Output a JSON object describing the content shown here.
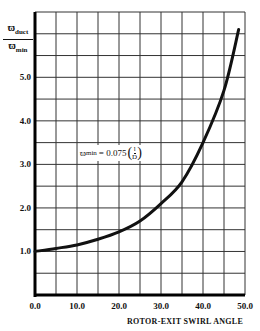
{
  "chart_data": {
    "type": "line",
    "title": "",
    "xlabel": "ROTOR-EXIT SWIRL ANGLE",
    "ylabel": "ϖ_duct / ϖ_min",
    "ylabel_parts": {
      "num_sym": "ϖ",
      "num_sub": "duct",
      "den_sym": "ϖ",
      "den_sub": "min"
    },
    "xlim": [
      0,
      50
    ],
    "ylim": [
      0,
      6.5
    ],
    "x_ticks": [
      "0.0",
      "10.0",
      "20.0",
      "30.0",
      "40.0",
      "50.0"
    ],
    "y_ticks": [
      "1.0",
      "2.0",
      "3.0",
      "4.0",
      "5.0"
    ],
    "grid": true,
    "annotation": {
      "lhs_sym": "ϖ",
      "lhs_sub": "min",
      "rhs": "= 0.075",
      "frac_num": "l",
      "frac_den": "D"
    },
    "series": [
      {
        "name": "loss ratio",
        "x": [
          0,
          5,
          10,
          15,
          20,
          25,
          30,
          35,
          40,
          45,
          48.5
        ],
        "y": [
          1.0,
          1.07,
          1.15,
          1.28,
          1.45,
          1.7,
          2.1,
          2.6,
          3.5,
          4.7,
          6.1
        ]
      }
    ]
  }
}
